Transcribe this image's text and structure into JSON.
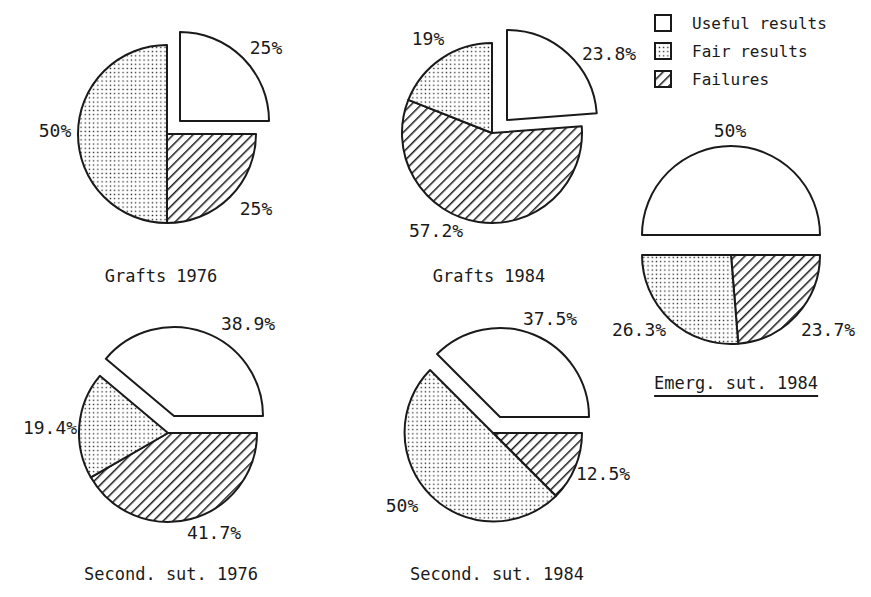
{
  "figure": {
    "background": "#ffffff",
    "ink": "#1a1a1a"
  },
  "legend": {
    "items": [
      {
        "label": "Useful results",
        "pattern": "plain"
      },
      {
        "label": "Fair results",
        "pattern": "dots"
      },
      {
        "label": "Failures",
        "pattern": "hatch"
      }
    ]
  },
  "chart_data": [
    {
      "type": "pie",
      "title": "Grafts 1976",
      "underline": false,
      "cx": 167,
      "cy": 134,
      "r": 89,
      "start_deg": 0,
      "title_pos": {
        "x": 161,
        "y": 276
      },
      "slices": [
        {
          "name": "Useful results",
          "pct": 25,
          "label": "25%",
          "pattern": "plain",
          "dx": 13,
          "dy": -13,
          "label_x": 266,
          "label_y": 47
        },
        {
          "name": "Failures",
          "pct": 25,
          "label": "25%",
          "pattern": "hatch",
          "dx": 0,
          "dy": 0,
          "label_x": 256,
          "label_y": 208
        },
        {
          "name": "Fair results",
          "pct": 50,
          "label": "50%",
          "pattern": "dots",
          "dx": 0,
          "dy": 0,
          "label_x": 55,
          "label_y": 130
        }
      ]
    },
    {
      "type": "pie",
      "title": "Grafts 1984",
      "underline": false,
      "cx": 492,
      "cy": 133,
      "r": 90,
      "start_deg": 0,
      "title_pos": {
        "x": 489,
        "y": 276
      },
      "slices": [
        {
          "name": "Useful results",
          "pct": 23.8,
          "label": "23.8%",
          "pattern": "plain",
          "dx": 15,
          "dy": -13,
          "label_x": 609,
          "label_y": 53
        },
        {
          "name": "Failures",
          "pct": 57.2,
          "label": "57.2%",
          "pattern": "hatch",
          "dx": 0,
          "dy": 0,
          "label_x": 436,
          "label_y": 230
        },
        {
          "name": "Fair results",
          "pct": 19,
          "label": "19%",
          "pattern": "dots",
          "dx": 0,
          "dy": 0,
          "label_x": 428,
          "label_y": 38
        }
      ]
    },
    {
      "type": "pie",
      "title": "Second. sut. 1976",
      "underline": false,
      "cx": 168,
      "cy": 433,
      "r": 89,
      "start_deg": -50,
      "title_pos": {
        "x": 171,
        "y": 574
      },
      "slices": [
        {
          "name": "Useful results",
          "pct": 38.9,
          "label": "38.9%",
          "pattern": "plain",
          "dx": 6,
          "dy": -17,
          "label_x": 248,
          "label_y": 323
        },
        {
          "name": "Failures",
          "pct": 41.7,
          "label": "41.7%",
          "pattern": "hatch",
          "dx": 0,
          "dy": 0,
          "label_x": 214,
          "label_y": 532
        },
        {
          "name": "Fair results",
          "pct": 19.4,
          "label": "19.4%",
          "pattern": "dots",
          "dx": 0,
          "dy": 0,
          "label_x": 50,
          "label_y": 427
        }
      ]
    },
    {
      "type": "pie",
      "title": "Second. sut. 1984",
      "underline": false,
      "cx": 493,
      "cy": 433,
      "r": 89,
      "start_deg": -45,
      "title_pos": {
        "x": 497,
        "y": 574
      },
      "slices": [
        {
          "name": "Useful results",
          "pct": 37.5,
          "label": "37.5%",
          "pattern": "plain",
          "dx": 7,
          "dy": -16,
          "label_x": 550,
          "label_y": 318
        },
        {
          "name": "Failures",
          "pct": 12.5,
          "label": "12.5%",
          "pattern": "hatch",
          "dx": 0,
          "dy": 0,
          "label_x": 603,
          "label_y": 473
        },
        {
          "name": "Fair results",
          "pct": 50,
          "label": "50%",
          "pattern": "dots",
          "dx": 0,
          "dy": 0,
          "label_x": 402,
          "label_y": 505
        }
      ]
    },
    {
      "type": "pie",
      "title": "Emerg. sut. 1984",
      "underline": true,
      "cx": 731,
      "cy": 245,
      "r": 89,
      "start_deg": -90,
      "title_pos": {
        "x": 736,
        "y": 385
      },
      "slices": [
        {
          "name": "Useful results",
          "pct": 50,
          "label": "50%",
          "pattern": "plain",
          "dx": 0,
          "dy": -10,
          "label_x": 730,
          "label_y": 130
        },
        {
          "name": "Failures",
          "pct": 23.7,
          "label": "23.7%",
          "pattern": "hatch",
          "dx": 0,
          "dy": 10,
          "label_x": 828,
          "label_y": 329
        },
        {
          "name": "Fair results",
          "pct": 26.3,
          "label": "26.3%",
          "pattern": "dots",
          "dx": 0,
          "dy": 10,
          "label_x": 639,
          "label_y": 329
        }
      ]
    }
  ]
}
